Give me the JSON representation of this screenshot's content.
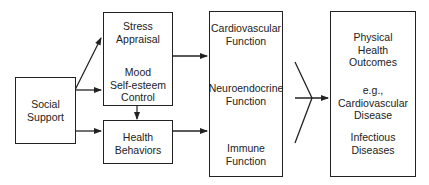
{
  "diagram": {
    "nodes": {
      "social_support": {
        "label": "Social\nSupport"
      },
      "stress_appraisal": {
        "label": "Stress\nAppraisal"
      },
      "mood": {
        "label": "Mood\nSelf-esteem\nControl"
      },
      "health_behaviors": {
        "label": "Health\nBehaviors"
      },
      "cardiovascular": {
        "label": "Cardiovascular\nFunction"
      },
      "neuroendocrine": {
        "label": "Neuroendocrine\nFunction"
      },
      "immune": {
        "label": "Immune\nFunction"
      },
      "outcomes_title": {
        "label": "Physical\nHealth\nOutcomes"
      },
      "outcomes_example": {
        "label": "e.g.,\nCardiovascular\nDisease"
      },
      "outcomes_infectious": {
        "label": "Infectious\nDiseases"
      }
    },
    "edges": [
      {
        "from": "social_support",
        "to": "stress_appraisal"
      },
      {
        "from": "social_support",
        "to": "mood"
      },
      {
        "from": "social_support",
        "to": "health_behaviors"
      },
      {
        "from": "stress_appraisal",
        "to": "mood"
      },
      {
        "from": "mood",
        "to": "health_behaviors"
      },
      {
        "from": "stress_appraisal_mood",
        "to": "cardiovascular"
      },
      {
        "from": "health_behaviors",
        "to": "immune"
      },
      {
        "from": "neuroendocrine",
        "to": "cardiovascular"
      },
      {
        "from": "neuroendocrine",
        "to": "immune"
      },
      {
        "from": "physiological_box",
        "to": "outcomes"
      }
    ]
  }
}
